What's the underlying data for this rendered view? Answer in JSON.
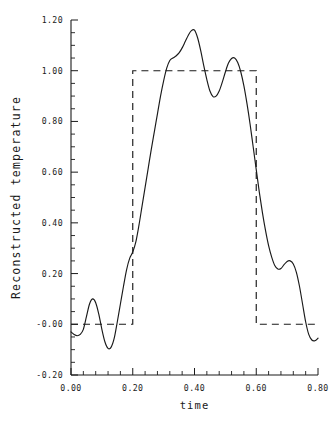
{
  "chart_data": {
    "type": "line",
    "title": "",
    "xlabel": "time",
    "ylabel": "Reconstructed temperature",
    "xlim": [
      0.0,
      0.8
    ],
    "ylim": [
      -0.2,
      1.2
    ],
    "grid": false,
    "legend": null,
    "x_ticks": [
      "0.00",
      "0.20",
      "0.40",
      "0.60",
      "0.80"
    ],
    "x_tick_values": [
      0.0,
      0.2,
      0.4,
      0.6,
      0.8
    ],
    "x_minor_step": 0.04,
    "y_ticks": [
      "-0.20",
      "-0.00",
      "0.20",
      "0.40",
      "0.60",
      "0.80",
      "1.00",
      "1.20"
    ],
    "y_tick_values": [
      -0.2,
      -0.0,
      0.2,
      0.4,
      0.6,
      0.8,
      1.0,
      1.2
    ],
    "y_minor_step": 0.05,
    "series": [
      {
        "name": "Reconstructed temperature",
        "style": "solid",
        "color": "#1a1a1a",
        "x": [
          0.0,
          0.01,
          0.02,
          0.03,
          0.04,
          0.05,
          0.06,
          0.07,
          0.08,
          0.09,
          0.1,
          0.11,
          0.12,
          0.13,
          0.14,
          0.15,
          0.16,
          0.17,
          0.18,
          0.19,
          0.2,
          0.21,
          0.22,
          0.23,
          0.24,
          0.25,
          0.26,
          0.27,
          0.28,
          0.29,
          0.3,
          0.31,
          0.32,
          0.33,
          0.34,
          0.35,
          0.36,
          0.37,
          0.38,
          0.39,
          0.4,
          0.41,
          0.42,
          0.43,
          0.44,
          0.45,
          0.46,
          0.47,
          0.48,
          0.49,
          0.5,
          0.51,
          0.52,
          0.53,
          0.54,
          0.55,
          0.56,
          0.57,
          0.58,
          0.59,
          0.6,
          0.61,
          0.62,
          0.63,
          0.64,
          0.65,
          0.66,
          0.67,
          0.68,
          0.69,
          0.7,
          0.71,
          0.72,
          0.73,
          0.74,
          0.75,
          0.76,
          0.77,
          0.78,
          0.79,
          0.8
        ],
        "y": [
          -0.03,
          -0.04,
          -0.045,
          -0.04,
          -0.02,
          0.03,
          0.08,
          0.1,
          0.085,
          0.04,
          -0.02,
          -0.07,
          -0.095,
          -0.09,
          -0.055,
          0.01,
          0.08,
          0.15,
          0.215,
          0.26,
          0.285,
          0.325,
          0.39,
          0.465,
          0.54,
          0.615,
          0.69,
          0.76,
          0.83,
          0.9,
          0.96,
          1.01,
          1.04,
          1.05,
          1.058,
          1.07,
          1.09,
          1.115,
          1.14,
          1.158,
          1.16,
          1.13,
          1.08,
          1.02,
          0.965,
          0.92,
          0.898,
          0.9,
          0.92,
          0.955,
          0.995,
          1.03,
          1.048,
          1.05,
          1.032,
          0.995,
          0.94,
          0.87,
          0.79,
          0.7,
          0.61,
          0.52,
          0.44,
          0.37,
          0.31,
          0.265,
          0.232,
          0.218,
          0.22,
          0.235,
          0.248,
          0.25,
          0.238,
          0.205,
          0.15,
          0.08,
          0.01,
          -0.04,
          -0.062,
          -0.065,
          -0.055
        ]
      },
      {
        "name": "Original square pulse",
        "style": "dashed",
        "color": "#1a1a1a",
        "x": [
          0.0,
          0.2,
          0.2,
          0.6,
          0.6,
          0.8
        ],
        "y": [
          0.0,
          0.0,
          1.0,
          1.0,
          0.0,
          0.0
        ]
      }
    ]
  }
}
